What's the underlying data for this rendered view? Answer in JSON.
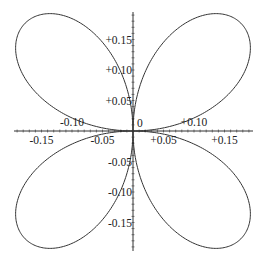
{
  "chart_data": {
    "type": "line",
    "title": "",
    "equation": "r = 0.25 sin(2θ)",
    "xlabel": "",
    "ylabel": "",
    "xlim": [
      -0.195,
      0.195
    ],
    "ylim": [
      -0.195,
      0.195
    ],
    "x_ticks": [
      {
        "value": -0.15,
        "label": "-0.15"
      },
      {
        "value": -0.1,
        "label": "-0.10"
      },
      {
        "value": -0.05,
        "label": "-0.05"
      },
      {
        "value": 0.05,
        "label": "+0.05"
      },
      {
        "value": 0.1,
        "label": "+0.10"
      },
      {
        "value": 0.15,
        "label": "+0.15"
      }
    ],
    "y_ticks": [
      {
        "value": 0.15,
        "label": "+0.15"
      },
      {
        "value": 0.1,
        "label": "+0.10"
      },
      {
        "value": 0.05,
        "label": "+0.05"
      },
      {
        "value": -0.05,
        "label": "-0.05"
      },
      {
        "value": -0.1,
        "label": "-0.10"
      },
      {
        "value": -0.15,
        "label": "-0.15"
      }
    ],
    "origin_label": "0",
    "amplitude": 0.25,
    "petals": 4,
    "grid": false,
    "legend": null
  }
}
